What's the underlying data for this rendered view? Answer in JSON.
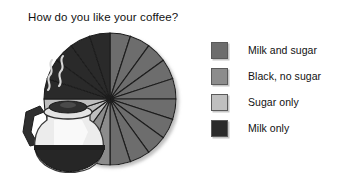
{
  "slide": {
    "title": "How do you like your coffee?",
    "background_color": "#ffffff"
  },
  "legend": {
    "position": "right",
    "items": [
      {
        "label": "Milk and sugar",
        "color": "#6d6d6d",
        "swatch_name": "legend-swatch-milk-and-sugar"
      },
      {
        "label": "Black, no sugar",
        "color": "#8c8c8c",
        "swatch_name": "legend-swatch-black-no-sugar"
      },
      {
        "label": "Sugar only",
        "color": "#bfbfbf",
        "swatch_name": "legend-swatch-sugar-only"
      },
      {
        "label": "Milk only",
        "color": "#2b2b2b",
        "swatch_name": "legend-swatch-milk-only"
      }
    ]
  },
  "illustration": {
    "name": "coffee-pot-illustration",
    "description": "Glass coffee carafe with dark handle, lid and coffee, with steam wisps",
    "glass_color": "#e9e9e9",
    "handle_color": "#2e2e2e",
    "coffee_color": "#242424",
    "steam_color": "#d6d6d6"
  },
  "chart_data": {
    "type": "pie",
    "title": "How do you like your coffee?",
    "categories": [
      "Milk and sugar",
      "Black, no sugar",
      "Sugar only",
      "Milk only"
    ],
    "values": [
      50,
      10,
      15,
      25
    ],
    "value_unit": "percent",
    "wedge_counts": [
      10,
      2,
      3,
      5
    ],
    "total_wedges": 20,
    "wedge_degrees": 18,
    "colors": [
      "#6d6d6d",
      "#8c8c8c",
      "#bfbfbf",
      "#2b2b2b"
    ],
    "start_angle_deg": -90,
    "direction": "clockwise",
    "separator_color": "#1c1c1c",
    "legend_position": "right",
    "grid": false,
    "labels_shown": false
  }
}
